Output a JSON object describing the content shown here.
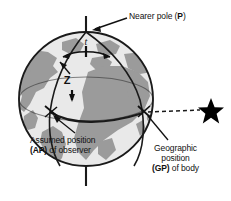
{
  "figure": {
    "colors": {
      "ocean": "#e9e9e9",
      "land": "#9b9b9b",
      "outline": "#1a1a1a",
      "star": "#000000",
      "background": "#ffffff",
      "text": "#111111"
    }
  },
  "labels": {
    "nearer_pole": {
      "text_plain": "Nearer pole (P)",
      "prefix": "Nearer pole (",
      "bold": "P",
      "suffix": ")"
    },
    "assumed_position": {
      "line1": "Assumed position",
      "line2_bold": "(AP)",
      "line2_rest": " of observer"
    },
    "geographic_position": {
      "line1": "Geographic",
      "line2": "position",
      "line3_bold": "(GP)",
      "line3_rest": " of body"
    },
    "zenith_distance": "Z",
    "meridian_angle": "t"
  },
  "markers": {
    "star": "star-icon",
    "pole_axis": "polar-axis-line",
    "sight_line": "dashed-line-to-body"
  }
}
